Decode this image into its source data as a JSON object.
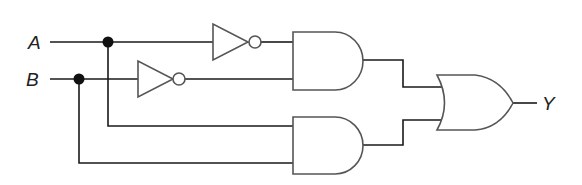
{
  "diagram": {
    "type": "logic-circuit",
    "inputs": [
      {
        "id": "A",
        "label": "A"
      },
      {
        "id": "B",
        "label": "B"
      }
    ],
    "output": {
      "id": "Y",
      "label": "Y"
    },
    "gates": [
      {
        "id": "not1",
        "type": "NOT",
        "input": "A"
      },
      {
        "id": "not2",
        "type": "NOT",
        "input": "B"
      },
      {
        "id": "and1",
        "type": "AND",
        "inputs": [
          "not1",
          "not2"
        ]
      },
      {
        "id": "and2",
        "type": "AND",
        "inputs": [
          "A",
          "B"
        ]
      },
      {
        "id": "or1",
        "type": "OR",
        "inputs": [
          "and1",
          "and2"
        ],
        "output": "Y"
      }
    ],
    "colors": {
      "wire": "#1a1a1a",
      "gate_outline": "#555555",
      "junction": "#111111",
      "background": "#ffffff"
    }
  }
}
